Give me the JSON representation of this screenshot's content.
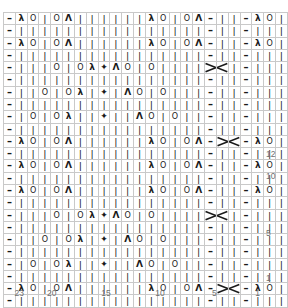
{
  "chart_data": {
    "type": "table",
    "xlabel": "Stitch number",
    "ylabel": "Row number",
    "grid": true,
    "columns": 24,
    "rows": 24,
    "col_tick_labels": [
      "23",
      "20",
      "15",
      "10",
      "5",
      "1"
    ],
    "col_tick_positions": [
      23,
      20,
      15,
      10,
      5,
      1
    ],
    "row_tick_labels": [
      "12",
      "10",
      "5",
      "1"
    ],
    "row_tick_positions": [
      12,
      10,
      5,
      1
    ],
    "legend": [],
    "symbols": {
      "knit": "|",
      "purl": "–",
      "yarnover": "O",
      "ssk": "λ",
      "k2tog": "Ʌ",
      "centered_double_dec": "✦",
      "cable_cross": "✖"
    },
    "symbol_names": {
      "knit": "knit-stitch",
      "purl": "purl-stitch",
      "yarnover": "yarn-over",
      "ssk": "ssk-decrease",
      "k2tog": "k2tog-decrease",
      "centered_double_dec": "centered-double-decrease",
      "cable_cross": "cable-cross"
    },
    "cell_codes": [
      [
        "p",
        "ssk",
        "yo",
        "k",
        "yo",
        "k2tog",
        "k",
        "k",
        "k",
        "k",
        "k",
        "k",
        "ssk",
        "yo",
        "k",
        "yo",
        "k2tog",
        "p",
        "k",
        "k",
        "p",
        "ssk",
        "yo",
        "k"
      ],
      [
        "p",
        "k",
        "k",
        "k",
        "k",
        "k",
        "k",
        "k",
        "k",
        "k",
        "k",
        "k",
        "k",
        "k",
        "k",
        "k",
        "k",
        "p",
        "k",
        "k",
        "p",
        "k",
        "k",
        "k"
      ],
      [
        "p",
        "ssk",
        "yo",
        "k",
        "yo",
        "k2tog",
        "k",
        "k",
        "k",
        "k",
        "k",
        "k",
        "ssk",
        "yo",
        "k",
        "yo",
        "k2tog",
        "p",
        "k",
        "k",
        "p",
        "ssk",
        "yo",
        "k"
      ],
      [
        "p",
        "k",
        "k",
        "k",
        "k",
        "k",
        "k",
        "k",
        "k",
        "k",
        "k",
        "k",
        "k",
        "k",
        "k",
        "k",
        "k",
        "p",
        "k",
        "k",
        "p",
        "k",
        "k",
        "k"
      ],
      [
        "p",
        "k",
        "k",
        "k",
        "yo",
        "k",
        "yo",
        "ssk",
        "cdd",
        "k2tog",
        "yo",
        "k",
        "yo",
        "k",
        "k",
        "k",
        "k",
        "cabL",
        "cabR",
        "k",
        "p",
        "k",
        "k",
        "k"
      ],
      [
        "p",
        "k",
        "k",
        "k",
        "k",
        "k",
        "k",
        "k",
        "k",
        "k",
        "k",
        "k",
        "k",
        "k",
        "k",
        "k",
        "k",
        "p",
        "k",
        "k",
        "p",
        "k",
        "k",
        "k"
      ],
      [
        "p",
        "k",
        "k",
        "yo",
        "k",
        "yo",
        "ssk",
        "k",
        "cdd",
        "k",
        "k2tog",
        "yo",
        "k",
        "yo",
        "k",
        "k",
        "k",
        "p",
        "k",
        "k",
        "p",
        "k",
        "k",
        "k"
      ],
      [
        "p",
        "k",
        "k",
        "k",
        "k",
        "k",
        "k",
        "k",
        "k",
        "k",
        "k",
        "k",
        "k",
        "k",
        "k",
        "k",
        "k",
        "p",
        "k",
        "k",
        "p",
        "k",
        "k",
        "k"
      ],
      [
        "p",
        "k",
        "yo",
        "k",
        "yo",
        "ssk",
        "k",
        "k",
        "cdd",
        "k",
        "k",
        "k2tog",
        "yo",
        "k",
        "yo",
        "k",
        "k",
        "p",
        "k",
        "k",
        "p",
        "k",
        "k",
        "k"
      ],
      [
        "p",
        "k",
        "k",
        "k",
        "k",
        "k",
        "k",
        "k",
        "k",
        "k",
        "k",
        "k",
        "k",
        "k",
        "k",
        "k",
        "k",
        "p",
        "k",
        "k",
        "p",
        "k",
        "k",
        "k"
      ],
      [
        "p",
        "ssk",
        "yo",
        "k",
        "yo",
        "k2tog",
        "k",
        "k",
        "k",
        "k",
        "k",
        "k",
        "ssk",
        "yo",
        "k",
        "yo",
        "k2tog",
        "p",
        "cabL",
        "cabR",
        "p",
        "ssk",
        "yo",
        "k"
      ],
      [
        "p",
        "k",
        "k",
        "k",
        "k",
        "k",
        "k",
        "k",
        "k",
        "k",
        "k",
        "k",
        "k",
        "k",
        "k",
        "k",
        "k",
        "p",
        "k",
        "k",
        "p",
        "k",
        "k",
        "k"
      ],
      [
        "p",
        "ssk",
        "yo",
        "k",
        "yo",
        "k2tog",
        "k",
        "k",
        "k",
        "k",
        "k",
        "k",
        "ssk",
        "yo",
        "k",
        "yo",
        "k2tog",
        "p",
        "k",
        "k",
        "p",
        "ssk",
        "yo",
        "k"
      ],
      [
        "p",
        "k",
        "k",
        "k",
        "k",
        "k",
        "k",
        "k",
        "k",
        "k",
        "k",
        "k",
        "k",
        "k",
        "k",
        "k",
        "k",
        "p",
        "k",
        "k",
        "p",
        "k",
        "k",
        "k"
      ],
      [
        "p",
        "ssk",
        "yo",
        "k",
        "yo",
        "k2tog",
        "k",
        "k",
        "k",
        "k",
        "k",
        "k",
        "ssk",
        "yo",
        "k",
        "yo",
        "k2tog",
        "p",
        "k",
        "k",
        "p",
        "ssk",
        "yo",
        "k"
      ],
      [
        "p",
        "k",
        "k",
        "k",
        "k",
        "k",
        "k",
        "k",
        "k",
        "k",
        "k",
        "k",
        "k",
        "k",
        "k",
        "k",
        "k",
        "p",
        "k",
        "k",
        "p",
        "k",
        "k",
        "k"
      ],
      [
        "p",
        "k",
        "k",
        "k",
        "yo",
        "k",
        "yo",
        "ssk",
        "cdd",
        "k2tog",
        "yo",
        "k",
        "yo",
        "k",
        "k",
        "k",
        "k",
        "cabL",
        "cabR",
        "k",
        "p",
        "k",
        "k",
        "k"
      ],
      [
        "p",
        "k",
        "k",
        "k",
        "k",
        "k",
        "k",
        "k",
        "k",
        "k",
        "k",
        "k",
        "k",
        "k",
        "k",
        "k",
        "k",
        "p",
        "k",
        "k",
        "p",
        "k",
        "k",
        "k"
      ],
      [
        "p",
        "k",
        "k",
        "yo",
        "k",
        "yo",
        "ssk",
        "k",
        "cdd",
        "k",
        "k2tog",
        "yo",
        "k",
        "yo",
        "k",
        "k",
        "k",
        "p",
        "k",
        "k",
        "p",
        "k",
        "k",
        "k"
      ],
      [
        "p",
        "k",
        "k",
        "k",
        "k",
        "k",
        "k",
        "k",
        "k",
        "k",
        "k",
        "k",
        "k",
        "k",
        "k",
        "k",
        "k",
        "p",
        "k",
        "k",
        "p",
        "k",
        "k",
        "k"
      ],
      [
        "p",
        "k",
        "yo",
        "k",
        "yo",
        "ssk",
        "k",
        "k",
        "cdd",
        "k",
        "k",
        "k2tog",
        "yo",
        "k",
        "yo",
        "k",
        "k",
        "p",
        "k",
        "k",
        "p",
        "k",
        "k",
        "k"
      ],
      [
        "p",
        "k",
        "k",
        "k",
        "k",
        "k",
        "k",
        "k",
        "k",
        "k",
        "k",
        "k",
        "k",
        "k",
        "k",
        "k",
        "k",
        "p",
        "k",
        "k",
        "p",
        "k",
        "k",
        "k"
      ],
      [
        "p",
        "ssk",
        "yo",
        "k",
        "yo",
        "k2tog",
        "k",
        "k",
        "k",
        "k",
        "k",
        "k",
        "ssk",
        "yo",
        "k",
        "yo",
        "k2tog",
        "p",
        "cabL",
        "cabR",
        "p",
        "ssk",
        "yo",
        "k"
      ],
      [
        "p",
        "k",
        "k",
        "k",
        "k",
        "k",
        "k",
        "k",
        "k",
        "k",
        "k",
        "k",
        "k",
        "k",
        "k",
        "k",
        "k",
        "p",
        "k",
        "k",
        "p",
        "k",
        "k",
        "k"
      ]
    ]
  },
  "colors": {
    "grid_line": "#c9c9c9",
    "grid_border": "#8a8a8a",
    "symbol": "#1a1a1a",
    "axis_label": "#6f6f6f",
    "background": "#ffffff"
  }
}
